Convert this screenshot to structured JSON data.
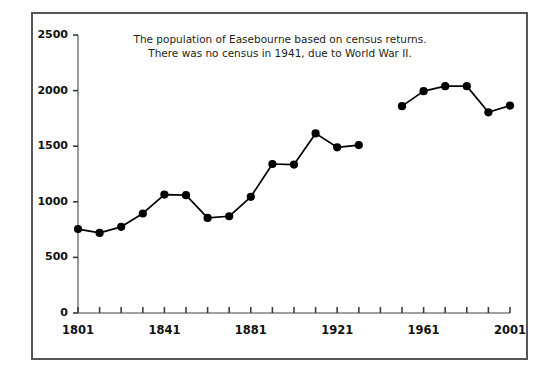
{
  "chart_data": {
    "type": "line",
    "title": "The population of Easebourne based on census returns.",
    "subtitle": "There was no census in 1941, due to World War II.",
    "xlabel": "",
    "ylabel": "",
    "xlim": [
      1801,
      2001
    ],
    "ylim": [
      0,
      2500
    ],
    "grid": false,
    "legend": null,
    "marker": "filled-circle",
    "line_color": "#000000",
    "marker_color": "#000000",
    "axis_color": "#808285",
    "frame_color": "#55565a",
    "x_tick_labels": [
      "1801",
      "1841",
      "1881",
      "1921",
      "1961",
      "2001"
    ],
    "x_tick_label_values": [
      1801,
      1841,
      1881,
      1921,
      1961,
      2001
    ],
    "x_minor_ticks": [
      1801,
      1811,
      1821,
      1831,
      1841,
      1851,
      1861,
      1871,
      1881,
      1891,
      1901,
      1911,
      1921,
      1931,
      1941,
      1951,
      1961,
      1971,
      1981,
      1991,
      2001
    ],
    "y_tick_labels": [
      "0",
      "500",
      "1000",
      "1500",
      "2000",
      "2500"
    ],
    "y_tick_values": [
      0,
      500,
      1000,
      1500,
      2000,
      2500
    ],
    "missing_years": [
      1941
    ],
    "x": [
      1801,
      1811,
      1821,
      1831,
      1841,
      1851,
      1861,
      1871,
      1881,
      1891,
      1901,
      1911,
      1921,
      1931,
      1951,
      1961,
      1971,
      1981,
      1991,
      2001
    ],
    "values": [
      755,
      720,
      775,
      895,
      1065,
      1060,
      855,
      870,
      1045,
      1340,
      1335,
      1615,
      1490,
      1510,
      1860,
      1995,
      2040,
      2040,
      1805,
      1865
    ],
    "segments": [
      {
        "from": 1801,
        "to": 1931
      },
      {
        "from": 1951,
        "to": 2001
      }
    ]
  }
}
